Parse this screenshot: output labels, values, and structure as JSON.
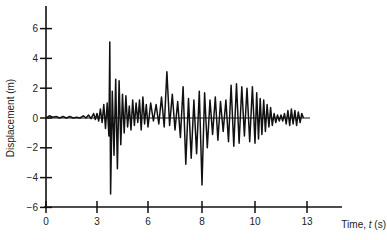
{
  "chart_data": {
    "type": "line",
    "title": "",
    "xlabel": "Time, t (s)",
    "ylabel": "Displacement (m)",
    "xlim": [
      0,
      13
    ],
    "ylim": [
      -6,
      6
    ],
    "x_ticks": [
      0,
      3,
      6,
      8,
      10,
      13
    ],
    "x_tick_labels": [
      "0",
      "3",
      "6",
      "8",
      "10",
      "13"
    ],
    "y_ticks": [
      6,
      4,
      2,
      0,
      -2,
      -4,
      -6
    ],
    "y_tick_labels": [
      "6",
      "4",
      "2",
      "0",
      "−2",
      "−4",
      "−6"
    ],
    "grid": false,
    "legend": null,
    "series": [
      {
        "name": "Displacement",
        "color": "#111111",
        "points": [
          [
            0.0,
            0.0
          ],
          [
            0.2,
            0.15
          ],
          [
            0.4,
            0.05
          ],
          [
            0.6,
            0.1
          ],
          [
            0.8,
            0.0
          ],
          [
            1.0,
            0.1
          ],
          [
            1.2,
            0.0
          ],
          [
            1.4,
            0.1
          ],
          [
            1.6,
            0.0
          ],
          [
            1.8,
            0.05
          ],
          [
            2.0,
            0.0
          ],
          [
            2.2,
            0.15
          ],
          [
            2.35,
            0.0
          ],
          [
            2.5,
            0.2
          ],
          [
            2.65,
            -0.05
          ],
          [
            2.8,
            0.3
          ],
          [
            2.9,
            -0.1
          ],
          [
            3.0,
            0.3
          ],
          [
            3.1,
            -0.2
          ],
          [
            3.2,
            0.6
          ],
          [
            3.3,
            -0.3
          ],
          [
            3.4,
            0.9
          ],
          [
            3.5,
            -0.7
          ],
          [
            3.6,
            1.0
          ],
          [
            3.7,
            -1.2
          ],
          [
            3.75,
            5.1
          ],
          [
            3.8,
            -5.1
          ],
          [
            3.9,
            1.8
          ],
          [
            4.0,
            -2.5
          ],
          [
            4.1,
            2.6
          ],
          [
            4.2,
            -3.4
          ],
          [
            4.3,
            2.5
          ],
          [
            4.4,
            -1.8
          ],
          [
            4.5,
            1.6
          ],
          [
            4.6,
            -1.0
          ],
          [
            4.7,
            1.5
          ],
          [
            4.8,
            -0.6
          ],
          [
            4.9,
            0.8
          ],
          [
            5.0,
            -0.8
          ],
          [
            5.1,
            1.2
          ],
          [
            5.2,
            -0.5
          ],
          [
            5.3,
            1.0
          ],
          [
            5.4,
            -0.3
          ],
          [
            5.5,
            1.2
          ],
          [
            5.6,
            -0.8
          ],
          [
            5.7,
            1.4
          ],
          [
            5.8,
            -0.4
          ],
          [
            5.9,
            0.9
          ],
          [
            6.0,
            -0.6
          ],
          [
            6.1,
            1.0
          ],
          [
            6.2,
            -0.2
          ],
          [
            6.3,
            0.9
          ],
          [
            6.4,
            -0.4
          ],
          [
            6.5,
            1.4
          ],
          [
            6.6,
            -0.6
          ],
          [
            6.7,
            3.1
          ],
          [
            6.8,
            -0.5
          ],
          [
            6.9,
            1.6
          ],
          [
            7.0,
            -0.8
          ],
          [
            7.1,
            1.1
          ],
          [
            7.2,
            -1.3
          ],
          [
            7.3,
            2.1
          ],
          [
            7.4,
            -3.1
          ],
          [
            7.5,
            1.3
          ],
          [
            7.6,
            -2.7
          ],
          [
            7.7,
            1.2
          ],
          [
            7.8,
            -2.4
          ],
          [
            7.9,
            1.8
          ],
          [
            8.0,
            -4.5
          ],
          [
            8.1,
            1.7
          ],
          [
            8.2,
            -2.0
          ],
          [
            8.3,
            1.2
          ],
          [
            8.4,
            -1.1
          ],
          [
            8.5,
            1.4
          ],
          [
            8.6,
            -1.5
          ],
          [
            8.7,
            1.1
          ],
          [
            8.8,
            -0.9
          ],
          [
            8.9,
            1.2
          ],
          [
            9.0,
            -1.6
          ],
          [
            9.1,
            2.2
          ],
          [
            9.2,
            -1.9
          ],
          [
            9.3,
            2.3
          ],
          [
            9.4,
            -1.7
          ],
          [
            9.5,
            2.1
          ],
          [
            9.6,
            -1.2
          ],
          [
            9.7,
            2.0
          ],
          [
            9.8,
            -1.6
          ],
          [
            9.9,
            2.1
          ],
          [
            10.0,
            -1.7
          ],
          [
            10.1,
            1.7
          ],
          [
            10.2,
            -1.4
          ],
          [
            10.3,
            1.3
          ],
          [
            10.4,
            -1.1
          ],
          [
            10.5,
            1.2
          ],
          [
            10.6,
            -0.9
          ],
          [
            10.7,
            0.9
          ],
          [
            10.8,
            -0.6
          ],
          [
            10.9,
            0.7
          ],
          [
            11.0,
            -0.5
          ],
          [
            11.1,
            0.3
          ],
          [
            11.2,
            -0.3
          ],
          [
            11.3,
            0.2
          ],
          [
            11.4,
            -0.2
          ],
          [
            11.5,
            0.2
          ],
          [
            11.6,
            -0.2
          ],
          [
            11.7,
            0.3
          ],
          [
            11.8,
            -0.4
          ],
          [
            11.9,
            0.5
          ],
          [
            12.0,
            -0.5
          ],
          [
            12.1,
            0.6
          ],
          [
            12.2,
            -0.4
          ],
          [
            12.3,
            0.5
          ],
          [
            12.4,
            -0.5
          ],
          [
            12.5,
            0.4
          ],
          [
            12.6,
            -0.3
          ],
          [
            12.7,
            0.3
          ],
          [
            12.8,
            0.0
          ]
        ]
      }
    ],
    "peaks": {
      "max": {
        "t": 3.75,
        "value": 5.1
      },
      "min": {
        "t": 3.8,
        "value": -5.1
      },
      "secondary_min": {
        "t": 8.0,
        "value": -4.5
      }
    }
  }
}
